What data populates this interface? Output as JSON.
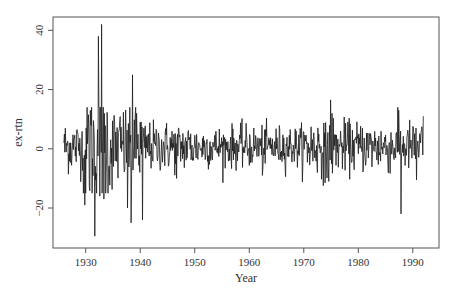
{
  "chart_data": {
    "type": "line",
    "title": "",
    "xlabel": "Year",
    "ylabel": "ex-rtn",
    "xlim": [
      1924.0,
      1994.8
    ],
    "ylim": [
      -33.5,
      44.5
    ],
    "xticks": [
      1930,
      1940,
      1950,
      1960,
      1970,
      1980,
      1990
    ],
    "xtick_labels": [
      "1930",
      "1940",
      "1950",
      "1960",
      "1970",
      "1980",
      "1990"
    ],
    "yticks": [
      -20,
      0,
      20,
      40
    ],
    "ytick_labels": [
      "-20",
      "0",
      "20",
      "40"
    ],
    "grid": false,
    "legend": null,
    "series": [
      {
        "name": "ex-rtn",
        "frequency": "monthly",
        "start": 1926.0,
        "end": 1991.92,
        "color": "#1a1a1a",
        "notable_points": [
          {
            "x": 1926.0,
            "y": 2.0
          },
          {
            "x": 1929.8,
            "y": -19.0
          },
          {
            "x": 1930.8,
            "y": 13.0
          },
          {
            "x": 1931.7,
            "y": -29.5
          },
          {
            "x": 1932.3,
            "y": 38.0
          },
          {
            "x": 1932.6,
            "y": -16.0
          },
          {
            "x": 1932.9,
            "y": 42.0
          },
          {
            "x": 1933.3,
            "y": -17.0
          },
          {
            "x": 1937.7,
            "y": -20.0
          },
          {
            "x": 1938.1,
            "y": 14.0
          },
          {
            "x": 1938.3,
            "y": -25.0
          },
          {
            "x": 1938.6,
            "y": 25.0
          },
          {
            "x": 1939.3,
            "y": 12.0
          },
          {
            "x": 1940.4,
            "y": -24.0
          },
          {
            "x": 1946.7,
            "y": -10.0
          },
          {
            "x": 1962.4,
            "y": -9.0
          },
          {
            "x": 1973.9,
            "y": -11.5
          },
          {
            "x": 1974.6,
            "y": -11.0
          },
          {
            "x": 1974.9,
            "y": 16.5
          },
          {
            "x": 1975.2,
            "y": 12.0
          },
          {
            "x": 1987.8,
            "y": -22.0
          },
          {
            "x": 1987.4,
            "y": 13.0
          },
          {
            "x": 1990.7,
            "y": -10.5
          },
          {
            "x": 1991.9,
            "y": 11.0
          }
        ],
        "volatility_by_period": [
          {
            "from": 1926.0,
            "to": 1929.5,
            "sd": 4.5
          },
          {
            "from": 1929.5,
            "to": 1934.5,
            "sd": 11.0
          },
          {
            "from": 1934.5,
            "to": 1940.5,
            "sd": 7.0
          },
          {
            "from": 1940.5,
            "to": 1950.0,
            "sd": 4.2
          },
          {
            "from": 1950.0,
            "to": 1970.0,
            "sd": 3.5
          },
          {
            "from": 1970.0,
            "to": 1975.5,
            "sd": 5.0
          },
          {
            "from": 1975.5,
            "to": 1992.0,
            "sd": 4.3
          }
        ],
        "mean": 0.7
      }
    ]
  },
  "plot_area": {
    "left": 53,
    "top": 17,
    "right": 439,
    "bottom": 248
  }
}
